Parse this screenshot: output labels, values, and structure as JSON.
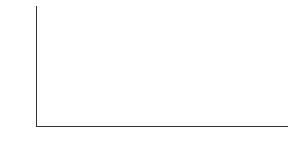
{
  "chart_data": {
    "type": "bar",
    "title": "",
    "xlabel": "",
    "ylabel": "Percent of children in poverty",
    "ylim": [
      0,
      40
    ],
    "yticks": [
      0,
      10,
      20,
      30,
      40
    ],
    "grid": false,
    "legend": null,
    "categories": [
      "Euro American",
      "African American",
      "Hispanic American",
      "All U.S. children"
    ],
    "category_lines": [
      [
        "Euro",
        "American"
      ],
      [
        "African",
        "American"
      ],
      [
        "Hispanic",
        "American"
      ],
      [
        "All U.S.",
        "children"
      ]
    ],
    "values": [
      9,
      37,
      33,
      17
    ],
    "bar_color": "#6e6e6e"
  }
}
